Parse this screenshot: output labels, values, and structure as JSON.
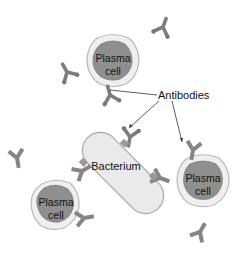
{
  "diagram": {
    "colors": {
      "background": "#ffffff",
      "cell_membrane_fill": "#efefef",
      "cell_membrane_stroke": "#b9b9b9",
      "nucleus_fill": "#8f8f8f",
      "nucleus_stroke": "#7a7a7a",
      "bacterium_fill": "#eaeaea",
      "bacterium_stroke": "#a8a8a8",
      "antibody": "#7d7d7d",
      "leader_line": "#333333"
    },
    "labels": {
      "antibodies": "Antibodies",
      "bacterium": "Bacterium"
    },
    "plasma_cells": [
      {
        "id": "top",
        "line1": "Plasma",
        "line2": "cell",
        "cx": 113,
        "cy": 60
      },
      {
        "id": "right",
        "line1": "Plasma",
        "line2": "cell",
        "cx": 203,
        "cy": 180
      },
      {
        "id": "bottom-left",
        "line1": "Plasma",
        "line2": "cell",
        "cx": 55,
        "cy": 204
      }
    ],
    "leader_lines": [
      {
        "from": "Antibodies",
        "to": "antibody near top plasma cell"
      },
      {
        "from": "Antibodies",
        "to": "antibody bound to bacterium"
      },
      {
        "from": "Antibodies",
        "to": "antibody near right plasma cell"
      }
    ],
    "free_antibodies_count": 5,
    "bound_antibodies_count": 4
  }
}
